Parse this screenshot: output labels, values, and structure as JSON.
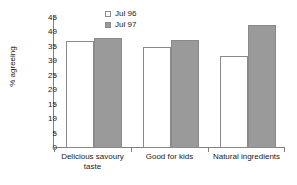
{
  "chart_data": {
    "type": "bar",
    "title": "",
    "subtitle": "",
    "xlabel": "",
    "ylabel": "% agreeing",
    "categories": [
      "Delicious savoury taste",
      "Good for kids",
      "Natural ingredients"
    ],
    "series": [
      {
        "name": "Jul 96",
        "values": [
          37,
          35,
          32
        ],
        "color": "#ffffff"
      },
      {
        "name": "Jul 97",
        "values": [
          38,
          37.5,
          42.5
        ],
        "color": "#9a9a9a"
      }
    ],
    "ylim": [
      0,
      45
    ],
    "yticks": [
      0,
      5,
      10,
      15,
      20,
      25,
      30,
      35,
      40,
      45
    ],
    "ytick_labels": [
      "0",
      "5",
      "10",
      "15",
      "20",
      "25",
      "30",
      "35",
      "40",
      "45"
    ],
    "grid": false,
    "legend_position": "top-center",
    "axis_color": "#808080",
    "bar_edge_color": "#8a8a8a"
  },
  "legend": {
    "items": [
      {
        "label": "Jul 96",
        "swatch": "hollow-square-swatch"
      },
      {
        "label": "Jul 97",
        "swatch": "filled-square-swatch"
      }
    ]
  }
}
